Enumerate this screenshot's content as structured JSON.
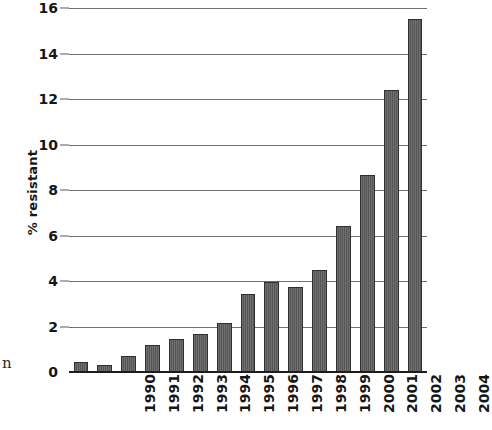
{
  "chart_data": {
    "type": "bar",
    "title": "",
    "subtitle": "",
    "xlabel": "",
    "ylabel": "% resistant",
    "categories": [
      "1990",
      "1991",
      "1992",
      "1993",
      "1994",
      "1995",
      "1996",
      "1997",
      "1998",
      "1999",
      "2000",
      "2001",
      "2002",
      "2003",
      "2004"
    ],
    "values": [
      0.45,
      0.3,
      0.7,
      1.2,
      1.45,
      1.65,
      2.15,
      3.45,
      3.95,
      3.75,
      4.5,
      6.4,
      8.65,
      12.4,
      15.5
    ],
    "series": [
      {
        "name": "% resistant",
        "values": [
          0.45,
          0.3,
          0.7,
          1.2,
          1.45,
          1.65,
          2.15,
          3.45,
          3.95,
          3.75,
          4.5,
          6.4,
          8.65,
          12.4,
          15.5
        ]
      }
    ],
    "ylim": [
      0,
      16
    ],
    "ytick_labels": [
      "0",
      "2",
      "4",
      "6",
      "8",
      "10",
      "12",
      "14",
      "16"
    ],
    "ytick_values": [
      0,
      2,
      4,
      6,
      8,
      10,
      12,
      14,
      16
    ],
    "xtick_labels": [
      "1990",
      "1991",
      "1992",
      "1993",
      "1994",
      "1995",
      "1996",
      "1997",
      "1998",
      "1999",
      "2000",
      "2001",
      "2002",
      "2003",
      "2004"
    ],
    "grid": true,
    "grid_axis": "y",
    "legend": false,
    "legend_position": "none",
    "annotations": [],
    "bar_color": "#5b5b5b",
    "bar_edge_color": "#2f2f2f",
    "gridline_color": "#6e6e6e",
    "axis_color": "#1d1d1d",
    "background_color": "#ffffff",
    "text_color": "#161616",
    "xtick_rotation": 90
  },
  "figure": {
    "edge_text_fragment": "n"
  }
}
